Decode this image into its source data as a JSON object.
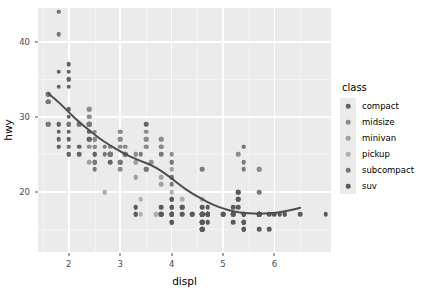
{
  "chart_data": {
    "type": "scatter",
    "title": "",
    "xlabel": "displ",
    "ylabel": "hwy",
    "xlim": [
      1.4,
      7.1
    ],
    "ylim": [
      12,
      44.5
    ],
    "xticks": [
      2,
      3,
      4,
      5,
      6
    ],
    "xtick_labels": [
      "2",
      "3",
      "4",
      "5",
      "6"
    ],
    "yticks": [
      20,
      30,
      40
    ],
    "ytick_labels": [
      "20",
      "30",
      "40"
    ],
    "x_minor_ticks": [
      1.5,
      2.5,
      3.5,
      4.5,
      5.5,
      6.5
    ],
    "y_minor_ticks": [
      15,
      25,
      35
    ],
    "grid": true,
    "panel_background": "#ebebeb",
    "grid_major_color": "#ffffff",
    "grid_minor_color": "#f4f4f4",
    "legend": {
      "title": "class",
      "position": "right",
      "entries": [
        {
          "label": "compact",
          "color": "#646464"
        },
        {
          "label": "midsize",
          "color": "#8c8c8c"
        },
        {
          "label": "minivan",
          "color": "#a0a0a0"
        },
        {
          "label": "pickup",
          "color": "#b0b0b0"
        },
        {
          "label": "subcompact",
          "color": "#787878"
        },
        {
          "label": "suv",
          "color": "#5a5a5a"
        }
      ]
    },
    "smooth": {
      "method": "loess",
      "color": "#4d4d4d",
      "width": 2.0,
      "points": [
        [
          1.6,
          33.1
        ],
        [
          1.8,
          32.0
        ],
        [
          2.0,
          30.6
        ],
        [
          2.2,
          29.3
        ],
        [
          2.4,
          28.2
        ],
        [
          2.6,
          27.1
        ],
        [
          2.8,
          26.2
        ],
        [
          3.0,
          25.4
        ],
        [
          3.2,
          24.7
        ],
        [
          3.4,
          24.1
        ],
        [
          3.6,
          23.6
        ],
        [
          3.8,
          22.8
        ],
        [
          4.0,
          21.8
        ],
        [
          4.2,
          20.7
        ],
        [
          4.4,
          19.8
        ],
        [
          4.6,
          19.0
        ],
        [
          4.8,
          18.3
        ],
        [
          5.0,
          17.8
        ],
        [
          5.2,
          17.4
        ],
        [
          5.4,
          17.2
        ],
        [
          5.6,
          17.1
        ],
        [
          5.8,
          17.1
        ],
        [
          6.0,
          17.2
        ],
        [
          6.2,
          17.4
        ],
        [
          6.4,
          17.7
        ],
        [
          6.5,
          17.9
        ]
      ]
    },
    "series": [
      {
        "name": "compact",
        "color": "#646464",
        "points": [
          [
            1.8,
            29
          ],
          [
            1.8,
            29
          ],
          [
            2.0,
            31
          ],
          [
            2.0,
            30
          ],
          [
            1.8,
            26
          ],
          [
            1.8,
            26
          ],
          [
            2.0,
            27
          ],
          [
            2.0,
            26
          ],
          [
            2.8,
            25
          ],
          [
            2.8,
            25
          ],
          [
            3.1,
            25
          ],
          [
            1.8,
            28
          ],
          [
            1.8,
            27
          ],
          [
            2.0,
            25
          ],
          [
            2.0,
            25
          ],
          [
            2.8,
            25
          ],
          [
            2.8,
            24
          ],
          [
            3.1,
            25
          ],
          [
            1.6,
            33
          ],
          [
            1.6,
            32
          ],
          [
            1.6,
            32
          ],
          [
            1.6,
            29
          ],
          [
            1.6,
            32
          ],
          [
            1.8,
            34
          ],
          [
            1.8,
            36
          ],
          [
            2.0,
            36
          ],
          [
            2.4,
            29
          ],
          [
            2.4,
            27
          ],
          [
            2.5,
            24
          ],
          [
            2.5,
            24
          ],
          [
            3.3,
            17
          ],
          [
            2.0,
            35
          ],
          [
            2.0,
            37
          ],
          [
            2.0,
            35
          ],
          [
            2.0,
            34
          ],
          [
            2.5,
            26
          ],
          [
            2.5,
            27
          ],
          [
            2.5,
            26
          ],
          [
            2.2,
            26
          ],
          [
            2.2,
            25
          ],
          [
            2.4,
            28
          ],
          [
            2.4,
            27
          ],
          [
            2.5,
            25
          ],
          [
            2.5,
            25
          ],
          [
            3.5,
            29
          ],
          [
            2.0,
            28
          ],
          [
            2.0,
            29
          ],
          [
            2.0,
            29
          ]
        ]
      },
      {
        "name": "midsize",
        "color": "#8c8c8c",
        "points": [
          [
            2.4,
            26
          ],
          [
            3.0,
            23
          ],
          [
            3.0,
            26
          ],
          [
            3.5,
            26
          ],
          [
            2.4,
            31
          ],
          [
            2.4,
            29
          ],
          [
            2.5,
            28
          ],
          [
            2.5,
            27
          ],
          [
            3.3,
            25
          ],
          [
            2.0,
            29
          ],
          [
            2.0,
            29
          ],
          [
            2.4,
            31
          ],
          [
            2.4,
            30
          ],
          [
            3.1,
            26
          ],
          [
            3.8,
            26
          ],
          [
            3.8,
            26
          ],
          [
            3.8,
            27
          ],
          [
            5.3,
            25
          ],
          [
            2.4,
            30
          ],
          [
            2.4,
            29
          ],
          [
            3.0,
            28
          ],
          [
            3.0,
            27
          ],
          [
            3.5,
            28
          ],
          [
            3.5,
            27
          ],
          [
            2.5,
            27
          ],
          [
            2.5,
            26
          ],
          [
            2.8,
            26
          ],
          [
            2.8,
            25
          ],
          [
            3.6,
            24
          ],
          [
            3.0,
            28
          ],
          [
            3.0,
            27
          ],
          [
            3.3,
            25
          ],
          [
            3.3,
            24
          ],
          [
            3.5,
            27
          ],
          [
            3.5,
            26
          ],
          [
            3.8,
            27
          ],
          [
            3.8,
            26
          ],
          [
            4.0,
            25
          ],
          [
            4.0,
            24
          ],
          [
            5.7,
            23
          ],
          [
            5.7,
            23
          ]
        ]
      },
      {
        "name": "minivan",
        "color": "#a0a0a0",
        "points": [
          [
            2.4,
            24
          ],
          [
            3.0,
            24
          ],
          [
            3.3,
            22
          ],
          [
            3.3,
            22
          ],
          [
            3.3,
            24
          ],
          [
            3.3,
            24
          ],
          [
            3.3,
            17
          ],
          [
            3.8,
            22
          ],
          [
            3.8,
            21
          ],
          [
            4.0,
            23
          ],
          [
            3.3,
            18
          ]
        ]
      },
      {
        "name": "pickup",
        "color": "#b0b0b0",
        "points": [
          [
            2.7,
            20
          ],
          [
            2.7,
            20
          ],
          [
            3.4,
            19
          ],
          [
            3.4,
            17
          ],
          [
            4.0,
            20
          ],
          [
            4.0,
            19
          ],
          [
            4.0,
            17
          ],
          [
            4.0,
            19
          ],
          [
            4.6,
            17
          ],
          [
            5.0,
            17
          ],
          [
            4.2,
            17
          ],
          [
            4.2,
            19
          ],
          [
            4.6,
            19
          ],
          [
            4.6,
            17
          ],
          [
            4.6,
            17
          ],
          [
            5.4,
            17
          ],
          [
            5.4,
            17
          ],
          [
            4.0,
            18
          ],
          [
            4.0,
            17
          ],
          [
            4.6,
            17
          ],
          [
            4.6,
            16
          ],
          [
            5.4,
            16
          ],
          [
            5.4,
            17
          ],
          [
            4.0,
            19
          ],
          [
            4.0,
            18
          ],
          [
            4.6,
            17
          ],
          [
            5.4,
            17
          ],
          [
            3.7,
            17
          ],
          [
            3.7,
            17
          ],
          [
            4.0,
            17
          ],
          [
            4.0,
            17
          ],
          [
            4.7,
            16
          ],
          [
            4.7,
            17
          ]
        ]
      },
      {
        "name": "subcompact",
        "color": "#787878",
        "points": [
          [
            1.8,
            44
          ],
          [
            1.8,
            44
          ],
          [
            1.8,
            41
          ],
          [
            2.0,
            29
          ],
          [
            2.0,
            26
          ],
          [
            2.8,
            25
          ],
          [
            2.8,
            25
          ],
          [
            3.1,
            25
          ],
          [
            1.6,
            33
          ],
          [
            1.6,
            32
          ],
          [
            1.6,
            32
          ],
          [
            1.6,
            29
          ],
          [
            1.6,
            32
          ],
          [
            2.2,
            29
          ],
          [
            2.2,
            29
          ],
          [
            2.4,
            29
          ],
          [
            2.4,
            29
          ],
          [
            3.0,
            24
          ],
          [
            3.0,
            24
          ],
          [
            3.5,
            23
          ],
          [
            3.5,
            23
          ],
          [
            4.0,
            22
          ],
          [
            4.0,
            22
          ],
          [
            5.4,
            26
          ],
          [
            5.4,
            26
          ],
          [
            2.5,
            23
          ],
          [
            2.5,
            24
          ],
          [
            3.8,
            25
          ],
          [
            4.6,
            23
          ],
          [
            5.4,
            24
          ],
          [
            5.4,
            23
          ],
          [
            2.7,
            26
          ],
          [
            2.7,
            25
          ],
          [
            3.4,
            25
          ],
          [
            4.0,
            24
          ],
          [
            4.0,
            21
          ],
          [
            5.7,
            20
          ]
        ]
      },
      {
        "name": "suv",
        "color": "#5a5a5a",
        "points": [
          [
            4.0,
            19
          ],
          [
            4.0,
            18
          ],
          [
            4.0,
            17
          ],
          [
            4.0,
            17
          ],
          [
            4.6,
            16
          ],
          [
            5.0,
            17
          ],
          [
            4.2,
            17
          ],
          [
            4.2,
            18
          ],
          [
            4.4,
            17
          ],
          [
            4.6,
            17
          ],
          [
            4.6,
            17
          ],
          [
            5.4,
            17
          ],
          [
            5.4,
            17
          ],
          [
            4.0,
            17
          ],
          [
            4.0,
            16
          ],
          [
            4.6,
            16
          ],
          [
            4.6,
            15
          ],
          [
            5.4,
            15
          ],
          [
            5.4,
            16
          ],
          [
            3.8,
            17
          ],
          [
            3.8,
            17
          ],
          [
            4.0,
            17
          ],
          [
            4.0,
            16
          ],
          [
            4.6,
            16
          ],
          [
            4.6,
            15
          ],
          [
            5.4,
            15
          ],
          [
            5.4,
            16
          ],
          [
            5.3,
            20
          ],
          [
            5.3,
            18
          ],
          [
            5.3,
            20
          ],
          [
            5.7,
            17
          ],
          [
            6.0,
            17
          ],
          [
            5.7,
            17
          ],
          [
            6.2,
            17
          ],
          [
            6.2,
            17
          ],
          [
            7.0,
            17
          ],
          [
            5.3,
            19
          ],
          [
            5.3,
            19
          ],
          [
            5.7,
            17
          ],
          [
            6.5,
            17
          ],
          [
            4.7,
            17
          ],
          [
            4.7,
            17
          ],
          [
            4.7,
            17
          ],
          [
            5.2,
            17
          ],
          [
            5.2,
            17
          ],
          [
            4.7,
            18
          ],
          [
            4.7,
            17
          ],
          [
            4.7,
            17
          ],
          [
            5.2,
            17
          ],
          [
            5.7,
            17
          ],
          [
            5.9,
            15
          ],
          [
            4.7,
            17
          ],
          [
            4.7,
            17
          ],
          [
            5.2,
            18
          ],
          [
            5.7,
            17
          ],
          [
            5.9,
            17
          ],
          [
            4.6,
            17
          ],
          [
            5.4,
            17
          ],
          [
            4.6,
            17
          ],
          [
            4.7,
            16
          ],
          [
            5.2,
            16
          ],
          [
            5.7,
            15
          ],
          [
            4.0,
            19
          ],
          [
            4.0,
            18
          ],
          [
            4.0,
            17
          ],
          [
            4.6,
            17
          ],
          [
            5.0,
            17
          ],
          [
            4.2,
            18
          ],
          [
            4.4,
            17
          ],
          [
            4.6,
            18
          ],
          [
            5.4,
            16
          ],
          [
            5.4,
            16
          ],
          [
            4.0,
            16
          ],
          [
            4.6,
            15
          ],
          [
            5.4,
            15
          ],
          [
            3.8,
            18
          ],
          [
            3.8,
            17
          ],
          [
            4.0,
            17
          ],
          [
            4.6,
            16
          ],
          [
            4.6,
            15
          ],
          [
            5.4,
            16
          ],
          [
            3.3,
            17
          ],
          [
            3.3,
            18
          ],
          [
            4.0,
            17
          ],
          [
            4.7,
            17
          ],
          [
            5.7,
            17
          ],
          [
            4.0,
            17
          ],
          [
            4.7,
            17
          ],
          [
            5.7,
            17
          ],
          [
            6.1,
            17
          ],
          [
            4.0,
            17
          ],
          [
            4.7,
            17
          ]
        ]
      }
    ]
  }
}
